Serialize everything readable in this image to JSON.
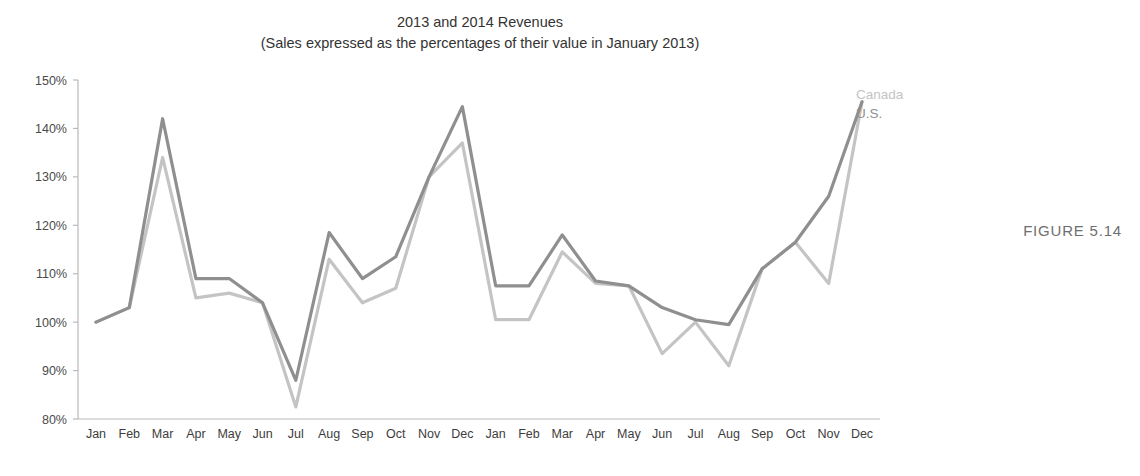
{
  "figure": {
    "caption": "FIGURE 5.14"
  },
  "chart_data": {
    "type": "line",
    "title": "2013 and 2014 Revenues",
    "subtitle": "(Sales expressed as the percentages of their value in January 2013)",
    "xlabel": "",
    "ylabel": "",
    "ylim": [
      80,
      150
    ],
    "ytick_values": [
      80,
      90,
      100,
      110,
      120,
      130,
      140,
      150
    ],
    "ytick_labels": [
      "80%",
      "90%",
      "100%",
      "110%",
      "120%",
      "130%",
      "140%",
      "150%"
    ],
    "grid": false,
    "legend_position": "right-inline-end-of-line",
    "categories": [
      "Jan",
      "Feb",
      "Mar",
      "Apr",
      "May",
      "Jun",
      "Jul",
      "Aug",
      "Sep",
      "Oct",
      "Nov",
      "Dec",
      "Jan",
      "Feb",
      "Mar",
      "Apr",
      "May",
      "Jun",
      "Jul",
      "Aug",
      "Sep",
      "Oct",
      "Nov",
      "Dec"
    ],
    "series": [
      {
        "name": "U.S.",
        "color": "#8f8f8f",
        "values": [
          100,
          103,
          142,
          109,
          109,
          104,
          88,
          118.5,
          109,
          113.5,
          130,
          144.5,
          107.5,
          107.5,
          118,
          108.5,
          107.5,
          103,
          100.5,
          99.5,
          111,
          116.5,
          126,
          145.5
        ]
      },
      {
        "name": "Canada",
        "color": "#c4c4c4",
        "values": [
          100,
          103,
          134,
          105,
          106,
          104,
          82.5,
          113,
          104,
          107,
          130,
          137,
          100.5,
          100.5,
          114.5,
          108,
          107.5,
          93.5,
          100,
          91,
          111,
          116.5,
          108,
          145.5
        ]
      }
    ]
  }
}
